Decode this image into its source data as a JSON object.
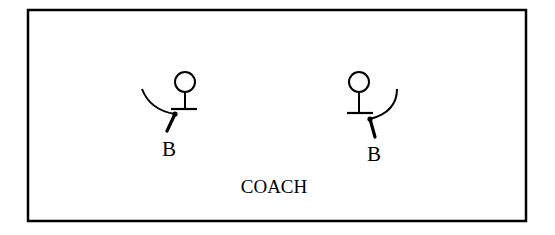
{
  "diagram": {
    "type": "court-positioning",
    "frame": {
      "x": 28,
      "y": 10,
      "width": 498,
      "height": 211,
      "stroke": "#000000"
    },
    "figures": [
      {
        "id": "player-left",
        "head": {
          "cx": 185,
          "cy": 82,
          "r": 10
        },
        "crossbar": {
          "x1": 171,
          "x2": 197,
          "y": 109
        },
        "arc": "M142,89 Q150,110 175,114",
        "stick": {
          "x1": 175,
          "y1": 114,
          "x2": 167,
          "y2": 131
        },
        "label": "B",
        "label_pos": {
          "x": 169,
          "y": 156
        }
      },
      {
        "id": "player-right",
        "head": {
          "cx": 359,
          "cy": 82,
          "r": 10
        },
        "crossbar": {
          "x1": 347,
          "x2": 373,
          "y": 113
        },
        "arc": "M397,89 Q397,112 370,119",
        "stick": {
          "x1": 370,
          "y1": 119,
          "x2": 375,
          "y2": 137
        },
        "label": "B",
        "label_pos": {
          "x": 374,
          "y": 161
        }
      }
    ],
    "caption": {
      "text": "COACH",
      "x": 274,
      "y": 193
    }
  }
}
